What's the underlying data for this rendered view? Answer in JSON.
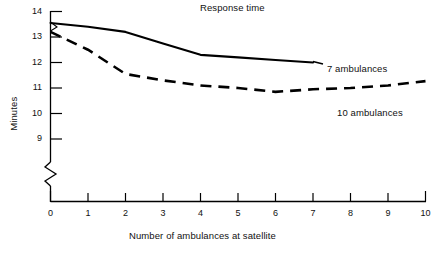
{
  "chart_data": {
    "type": "line",
    "title": "Response time",
    "xlabel": "Number of ambulances at satellite",
    "ylabel": "Minutes",
    "xlim": [
      0,
      10
    ],
    "ylim": [
      8.4,
      14
    ],
    "grid": false,
    "legend_position": "inline-right-of-series",
    "y_axis_break": true,
    "y_axis_break_note": "zigzag break between axis origin and the 9 tick",
    "xticks": [
      0,
      1,
      2,
      3,
      4,
      5,
      6,
      7,
      8,
      9,
      10
    ],
    "xtick_labels": [
      "0",
      "1",
      "2",
      "3",
      "4",
      "5",
      "6",
      "7",
      "8",
      "9",
      "10"
    ],
    "yticks": [
      9,
      10,
      11,
      12,
      13,
      14
    ],
    "ytick_labels": [
      "9",
      "10",
      "11",
      "12",
      "13",
      "14"
    ],
    "series": [
      {
        "name": "7 ambulances",
        "style": "solid",
        "color": "#000000",
        "x": [
          0,
          1,
          2,
          3,
          4,
          5,
          6,
          7
        ],
        "values": [
          13.55,
          13.4,
          13.2,
          12.75,
          12.3,
          12.2,
          12.1,
          12.0
        ]
      },
      {
        "name": "10 ambulances",
        "style": "dashed",
        "color": "#000000",
        "x": [
          0,
          1,
          2,
          3,
          4,
          5,
          6,
          7,
          8,
          9,
          10
        ],
        "values": [
          13.2,
          12.5,
          11.55,
          11.3,
          11.1,
          11.0,
          10.85,
          10.95,
          11.0,
          11.1,
          11.27
        ]
      }
    ]
  },
  "chart": {
    "title": "Response time",
    "xlabel": "Number of ambulances at satellite",
    "ylabel": "Minutes",
    "xtick_labels": [
      "0",
      "1",
      "2",
      "3",
      "4",
      "5",
      "6",
      "7",
      "8",
      "9",
      "10"
    ],
    "ytick_labels": [
      "9",
      "10",
      "11",
      "12",
      "13",
      "14"
    ],
    "series_labels": {
      "solid": "7 ambulances",
      "dashed": "10 ambulances"
    }
  }
}
